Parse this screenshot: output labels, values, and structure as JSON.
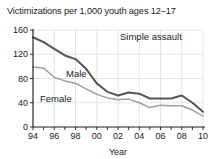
{
  "chart_data": {
    "type": "line",
    "title": "Victimizations per 1,000 youth ages 12–17",
    "xlabel": "Year",
    "ylabel": "",
    "annotation": "Simple assault",
    "xlim": [
      1994,
      2010
    ],
    "ylim": [
      0,
      160
    ],
    "grid": true,
    "legend_position": "inline-labels",
    "y_ticks": [
      0,
      40,
      80,
      120,
      160
    ],
    "y_tick_labels": [
      "0",
      "40",
      "80",
      "120",
      "160"
    ],
    "x_ticks": [
      1994,
      1995,
      1996,
      1997,
      1998,
      1999,
      2000,
      2001,
      2002,
      2003,
      2004,
      2005,
      2006,
      2007,
      2008,
      2009,
      2010
    ],
    "x_tick_labels": [
      "94",
      "",
      "96",
      "",
      "98",
      "",
      "00",
      "",
      "02",
      "",
      "04",
      "",
      "06",
      "",
      "08",
      "",
      "10"
    ],
    "x": [
      1994,
      1995,
      1996,
      1997,
      1998,
      1999,
      2000,
      2001,
      2002,
      2003,
      2004,
      2005,
      2006,
      2007,
      2008,
      2009,
      2010
    ],
    "series": [
      {
        "name": "Male",
        "color": "#565656",
        "values": [
          148,
          140,
          129,
          118,
          112,
          96,
          72,
          58,
          52,
          57,
          55,
          47,
          47,
          47,
          52,
          40,
          25
        ]
      },
      {
        "name": "Female",
        "color": "#a0a0a0",
        "values": [
          99,
          97,
          82,
          76,
          72,
          63,
          54,
          48,
          45,
          46,
          40,
          32,
          36,
          35,
          35,
          28,
          18
        ]
      }
    ]
  },
  "labels": {
    "male_label": "Male",
    "female_label": "Female",
    "annotation": "Simple assault",
    "axis_x_title": "Year"
  }
}
